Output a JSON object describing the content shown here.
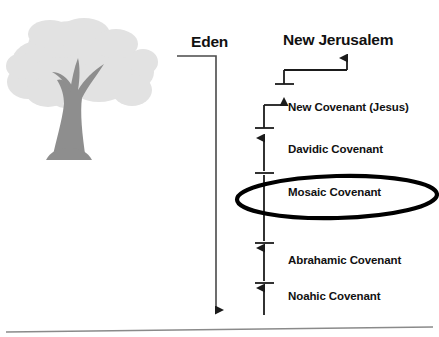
{
  "diagram": {
    "title_left": "Eden",
    "title_right": "New Jerusalem",
    "colors": {
      "ink": "#111111",
      "tree_canopy": "#e2e2e2",
      "tree_trunk": "#8e8e8e",
      "baseline": "#8a8a8a",
      "highlight_ellipse": "#000000",
      "eden_line": "#4a4a4a"
    },
    "tree": {
      "name": "tree-of-life-illustration"
    },
    "baseline": {
      "name": "ground-baseline"
    },
    "highlight": {
      "target": "Mosaic Covenant",
      "shape": "ellipse"
    },
    "eden_axis": {
      "label": "Eden",
      "direction": "downward"
    },
    "covenants": [
      {
        "id": "new-covenant",
        "label": "New Covenant (Jesus)"
      },
      {
        "id": "davidic-covenant",
        "label": "Davidic Covenant"
      },
      {
        "id": "mosaic-covenant",
        "label": "Mosaic Covenant"
      },
      {
        "id": "abrahamic-covenant",
        "label": "Abrahamic Covenant"
      },
      {
        "id": "noahic-covenant",
        "label": "Noahic Covenant"
      }
    ]
  }
}
